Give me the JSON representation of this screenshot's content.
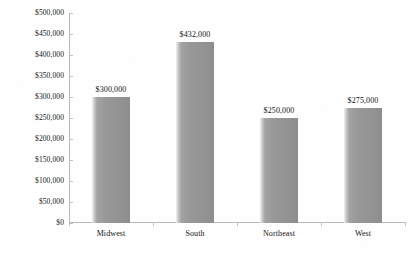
{
  "chart_data": {
    "type": "bar",
    "title": "",
    "subtitle": "",
    "xlabel": "",
    "ylabel": "",
    "categories": [
      "Midwest",
      "South",
      "Northeast",
      "West"
    ],
    "values": [
      300000,
      432000,
      250000,
      275000
    ],
    "value_labels": [
      "$300,000",
      "$432,000",
      "$250,000",
      "$275,000"
    ],
    "ylim": [
      0,
      500000
    ],
    "y_tick_values": [
      0,
      50000,
      100000,
      150000,
      200000,
      250000,
      300000,
      350000,
      400000,
      450000,
      500000
    ],
    "y_tick_labels": [
      "$0",
      "$50,000",
      "$100,000",
      "$150,000",
      "$200,000",
      "$250,000",
      "$300,000",
      "$350,000",
      "$400,000",
      "$450,000",
      "$500,000"
    ],
    "grid": false,
    "legend": "none",
    "bar_color": "#939393",
    "bar_gradient": [
      "#f2f2f2",
      "#8d8d8d"
    ],
    "axis_color": "#b9b9b9",
    "text_color": "#141414",
    "background": "#ffffff"
  }
}
